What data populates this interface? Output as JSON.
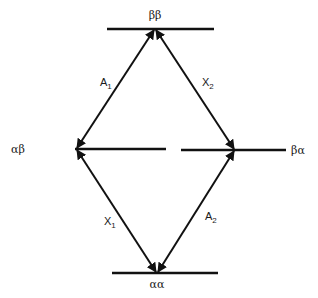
{
  "diagram": {
    "type": "energy-level-diagram",
    "colors": {
      "line": "#111111",
      "background": "#ffffff"
    },
    "levels": [
      {
        "id": "bb",
        "label": "ββ"
      },
      {
        "id": "ab",
        "label": "αβ"
      },
      {
        "id": "ba",
        "label": "βα"
      },
      {
        "id": "aa",
        "label": "αα"
      }
    ],
    "transitions": [
      {
        "from": "ab",
        "to": "bb",
        "label": "A",
        "sub": "1",
        "bidirectional": true
      },
      {
        "from": "bb",
        "to": "ba",
        "label": "X",
        "sub": "2",
        "bidirectional": true
      },
      {
        "from": "ab",
        "to": "aa",
        "label": "X",
        "sub": "1",
        "bidirectional": true
      },
      {
        "from": "aa",
        "to": "ba",
        "label": "A",
        "sub": "2",
        "bidirectional": true
      }
    ]
  }
}
